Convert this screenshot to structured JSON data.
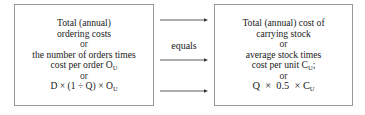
{
  "left_box": {
    "lines": [
      {
        "text": "Total (annual)"
      },
      {
        "text": "ordering costs"
      },
      {
        "text": "or"
      },
      {
        "text": "the number of orders times"
      },
      {
        "text": "cost per order O",
        "sub": "U"
      },
      {
        "text": "or"
      },
      {
        "text": "D × (1 ÷ Q) × O",
        "sub": "U"
      }
    ]
  },
  "connector": {
    "label": "equals",
    "arrow_count": 3
  },
  "right_box": {
    "lines": [
      {
        "text": "Total (annual) cost of"
      },
      {
        "text": "carrying stock"
      },
      {
        "text": "or"
      },
      {
        "text": "average stock times"
      },
      {
        "text": "cost per unit C",
        "sub": "U",
        "suffix": ";"
      },
      {
        "text": "or"
      },
      {
        "text": "Q  ×  0.5  × C",
        "sub": "U"
      }
    ]
  },
  "colors": {
    "border": "#9a9a9a",
    "text": "#1a1a1a",
    "arrow": "#333333"
  }
}
